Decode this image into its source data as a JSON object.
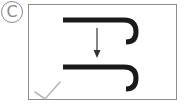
{
  "label": {
    "text": "C",
    "shape": "circled-letter"
  },
  "figure": {
    "status_mark": "checkmark",
    "colors": {
      "stroke": "#1a1a1a",
      "frame": "#8c8c8c",
      "arrow": "#333333",
      "check": "#b8b8b8",
      "label": "#8a8a8a"
    }
  }
}
